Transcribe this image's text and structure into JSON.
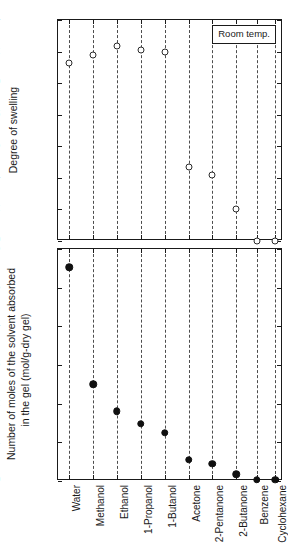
{
  "figure": {
    "background_color": "#ffffff",
    "foreground_color": "#1a1a1a",
    "gridline_color": "#4d4d4d"
  },
  "legend": {
    "text": "Room temp."
  },
  "chart_data": [
    {
      "type": "scatter",
      "panel": "top",
      "title": "",
      "xlabel": "",
      "ylabel": "Degree of swelling",
      "ylim": [
        0,
        14
      ],
      "yticks": [
        0,
        2,
        4,
        6,
        8,
        10,
        12,
        14
      ],
      "ytick_labels": [
        "0",
        "2",
        "4",
        "6",
        "8",
        "10",
        "12",
        "14"
      ],
      "grid": true,
      "grid_axis": "x",
      "legend": "Room temp.",
      "legend_position": "upper right",
      "marker": "open-circle",
      "categories": [
        "Water",
        "Methanol",
        "Ethanol",
        "1-Propanol",
        "1-Butanol",
        "Acetone",
        "2-Pentanone",
        "2-Butanone",
        "Benzene",
        "Cyclohexane"
      ],
      "values": [
        11.3,
        11.8,
        12.35,
        12.1,
        11.95,
        4.7,
        4.2,
        2.0,
        0.0,
        0.0
      ]
    },
    {
      "type": "scatter",
      "panel": "bottom",
      "title": "",
      "xlabel": "",
      "ylabel": "Number of moles of the solvent absorbed in the gel (mol/g-dry gel)",
      "ylabel_line1": "Number of moles of the solvent absorbed",
      "ylabel_line2": "in the gel (mol/g-dry gel)",
      "ylim": [
        0,
        0.6
      ],
      "yticks": [
        0,
        0.1,
        0.2,
        0.3,
        0.4,
        0.5,
        0.6
      ],
      "ytick_labels": [
        "0",
        "0.1",
        "0.2",
        "0.3",
        "0.4",
        "0.5",
        "0.6"
      ],
      "grid": true,
      "grid_axis": "x",
      "marker": "filled-circle",
      "categories": [
        "Water",
        "Methanol",
        "Ethanol",
        "1-Propanol",
        "1-Butanol",
        "Acetone",
        "2-Pentanone",
        "2-Butanone",
        "Benzene",
        "Cyclohexane"
      ],
      "values": [
        0.553,
        0.25,
        0.181,
        0.148,
        0.125,
        0.055,
        0.044,
        0.017,
        0.003,
        0.003
      ]
    }
  ],
  "x_categories": [
    "Water",
    "Methanol",
    "Ethanol",
    "1-Propanol",
    "1-Butanol",
    "Acetone",
    "2-Pentanone",
    "2-Butanone",
    "Benzene",
    "Cyclohexane"
  ]
}
